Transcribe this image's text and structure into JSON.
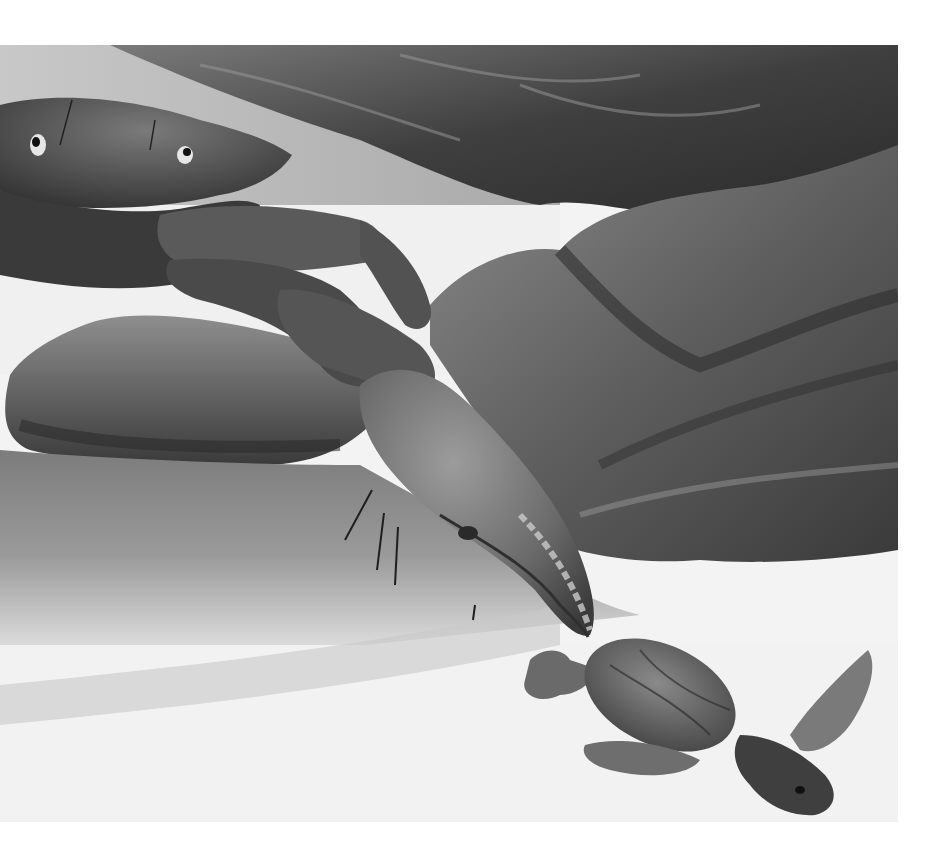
{
  "image": {
    "description": "Grayscale painted illustration of a large crab on a beach grabbing a sea turtle hatchling with its claw, rocks and a shallow tidal pool in the background",
    "style": "monochrome painting",
    "subjects": [
      "crab",
      "sea turtle hatchling",
      "rocks",
      "tidal water",
      "sand"
    ],
    "palette": {
      "sky": "#b5b5b5",
      "rock_dark": "#3a3a3a",
      "rock_mid": "#6e6e6e",
      "rock_light": "#9a9a9a",
      "crab_dark": "#2e2e2e",
      "crab_mid": "#5c5c5c",
      "crab_light": "#8c8c8c",
      "water": "#8f8f8f",
      "sand": "#f2f2f2",
      "background": "#ffffff"
    }
  }
}
